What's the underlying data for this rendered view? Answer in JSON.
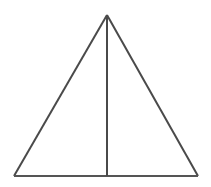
{
  "figure": {
    "name": "isosceles-triangle-with-median",
    "background_color": "#ffffff",
    "stroke_color": "#4a4a4a",
    "base_stroke_color": "#555555",
    "stroke_width": 2,
    "canvas": {
      "width": 211,
      "height": 187
    },
    "vertices": {
      "apex": {
        "label": "apex",
        "x": 107,
        "y": 15
      },
      "bottom_left": {
        "label": "bottom-left",
        "x": 14,
        "y": 176
      },
      "bottom_right": {
        "label": "bottom-right",
        "x": 198,
        "y": 176
      },
      "base_midpoint": {
        "label": "base-midpoint",
        "x": 107,
        "y": 176
      }
    },
    "segments": [
      {
        "name": "left-side",
        "from": "apex",
        "to": "bottom_left",
        "x1": 107,
        "y1": 15,
        "x2": 14,
        "y2": 176
      },
      {
        "name": "right-side",
        "from": "apex",
        "to": "bottom_right",
        "x1": 107,
        "y1": 15,
        "x2": 198,
        "y2": 176
      },
      {
        "name": "base",
        "from": "bottom_left",
        "to": "bottom_right",
        "x1": 14,
        "y1": 176,
        "x2": 198,
        "y2": 176
      },
      {
        "name": "median-altitude",
        "from": "apex",
        "to": "base_midpoint",
        "x1": 107,
        "y1": 15,
        "x2": 107,
        "y2": 176
      }
    ],
    "labels": [],
    "annotations": []
  }
}
